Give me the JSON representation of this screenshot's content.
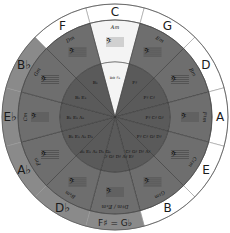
{
  "colors": {
    "outer_ring_white": "#ffffff",
    "outer_ring_gray": "#8a8a8a",
    "middle_ring": "#6e6e6e",
    "inner_ring": "#5a5a5a",
    "highlight": "#f4f4f4",
    "line": "#333333"
  },
  "center": {
    "x": 115,
    "y": 117
  },
  "radii": {
    "outer": 113,
    "ring": 97,
    "inner": 55
  },
  "segments": [
    {
      "major": "C",
      "minor": "Am",
      "accidentals": "no ♯♭",
      "ring": "white",
      "highlight": true
    },
    {
      "major": "G",
      "minor": "Em",
      "accidentals": "F♯",
      "ring": "white",
      "highlight": false
    },
    {
      "major": "D",
      "minor": "Bm",
      "accidentals": "F♯ C♯",
      "ring": "white",
      "highlight": false
    },
    {
      "major": "A",
      "minor": "F♯m",
      "accidentals": "F♯ C♯ G♯",
      "ring": "white",
      "highlight": false
    },
    {
      "major": "E",
      "minor": "C♯m",
      "accidentals": "F♯ C♯ G♯ D♯",
      "ring": "white",
      "highlight": false
    },
    {
      "major": "B",
      "minor": "G♯m",
      "accidentals": "F♯ C♯ G♯ D♯ A♯",
      "ring": "white",
      "highlight": false
    },
    {
      "major": "F♯ = G♭",
      "minor": "D♯m / E♭m",
      "accidentals": "F♯ C♯ G♯ D♯ A♯ E♯",
      "ring": "gray",
      "highlight": false
    },
    {
      "major": "D♭",
      "minor": "B♭m",
      "accidentals": "B♭ E♭ A♭ D♭ G♭",
      "ring": "gray",
      "highlight": false
    },
    {
      "major": "A♭",
      "minor": "Fm",
      "accidentals": "B♭ E♭ A♭ D♭",
      "ring": "gray",
      "highlight": false
    },
    {
      "major": "E♭",
      "minor": "Cm",
      "accidentals": "B♭ E♭ A♭",
      "ring": "gray",
      "highlight": false
    },
    {
      "major": "B♭",
      "minor": "Gm",
      "accidentals": "B♭ E♭",
      "ring": "gray",
      "highlight": false
    },
    {
      "major": "F",
      "minor": "Dm",
      "accidentals": "B♭",
      "ring": "white",
      "highlight": false
    }
  ]
}
